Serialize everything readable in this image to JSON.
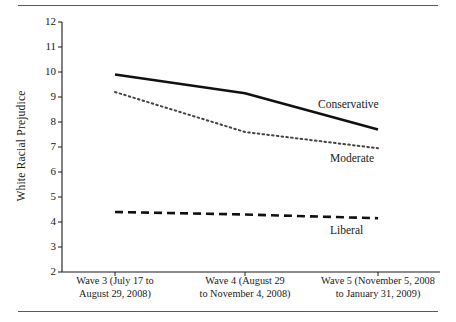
{
  "figure": {
    "ylabel": "White Racial Prejudice",
    "top_rule": "",
    "bottom_rule": ""
  },
  "axes": {
    "y_ticks": [
      "12",
      "11",
      "10",
      "9",
      "8",
      "7",
      "6",
      "5",
      "4",
      "3",
      "2"
    ],
    "x_tick_labels": [
      {
        "line1": "Wave 3 (July 17 to",
        "line2": "August 29, 2008)"
      },
      {
        "line1": "Wave 4 (August 29",
        "line2": "to November 4, 2008)"
      },
      {
        "line1": "Wave 5 (November 5, 2008",
        "line2": "to January 31, 2009)"
      }
    ]
  },
  "series_labels": {
    "conservative": "Conservative",
    "moderate": "Moderate",
    "liberal": "Liberal"
  },
  "chart_data": {
    "type": "line",
    "title": "",
    "xlabel": "",
    "ylabel": "White Racial Prejudice",
    "ylim": [
      2,
      12
    ],
    "ytick_step": 1,
    "grid": false,
    "legend": "inline-end-labels",
    "categories": [
      "Wave 3 (July 17 to August 29, 2008)",
      "Wave 4 (August 29 to November 4, 2008)",
      "Wave 5 (November 5, 2008 to January 31, 2009)"
    ],
    "series": [
      {
        "name": "Conservative",
        "style": "solid",
        "color": "#111111",
        "values": [
          9.9,
          9.15,
          7.7
        ]
      },
      {
        "name": "Moderate",
        "style": "dotted",
        "color": "#444444",
        "values": [
          9.2,
          7.6,
          6.95
        ]
      },
      {
        "name": "Liberal",
        "style": "dashed",
        "color": "#111111",
        "values": [
          4.4,
          4.3,
          4.15
        ]
      }
    ]
  }
}
